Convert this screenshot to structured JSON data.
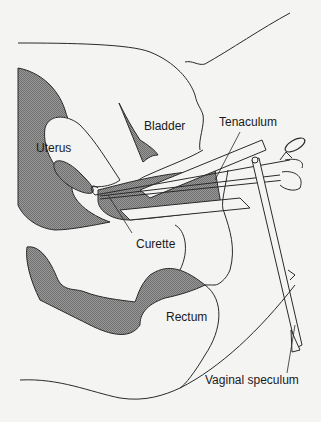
{
  "diagram": {
    "type": "anatomical-illustration",
    "labels": {
      "uterus": "Uterus",
      "bladder": "Bladder",
      "tenaculum": "Tenaculum",
      "curette": "Curette",
      "rectum": "Rectum",
      "vaginal_speculum": "Vaginal speculum"
    },
    "colors": {
      "background": "#f4f4f2",
      "line": "#2a2a2a",
      "hatch_fill": "#8a8a8a"
    }
  }
}
